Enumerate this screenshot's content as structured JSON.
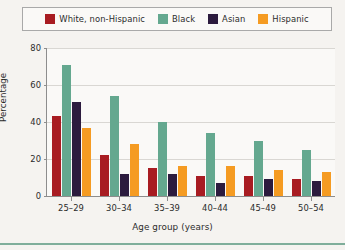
{
  "legend": {
    "entries": [
      {
        "label": "White, non-Hispanic",
        "color": "#a81c22"
      },
      {
        "label": "Black",
        "color": "#64a88f"
      },
      {
        "label": "Asian",
        "color": "#2c1b3e"
      },
      {
        "label": "Hispanic",
        "color": "#f59b22"
      }
    ]
  },
  "axes": {
    "y_title": "Percentage",
    "x_title": "Age group (years)",
    "y_ticks": [
      "0",
      "20",
      "40",
      "60",
      "80"
    ]
  },
  "chart_data": {
    "type": "bar",
    "title": "",
    "subtitle": "",
    "xlabel": "Age group (years)",
    "ylabel": "Percentage",
    "ylim": [
      0,
      80
    ],
    "yticks": [
      0,
      20,
      40,
      60,
      80
    ],
    "grid": true,
    "legend_position": "top",
    "categories": [
      "25–29",
      "30–34",
      "35–39",
      "40–44",
      "45–49",
      "50–54"
    ],
    "series": [
      {
        "name": "White, non-Hispanic",
        "color": "#a81c22",
        "values": [
          43,
          22,
          15,
          11,
          11,
          9
        ]
      },
      {
        "name": "Black",
        "color": "#64a88f",
        "values": [
          71,
          54,
          40,
          34,
          30,
          25
        ]
      },
      {
        "name": "Asian",
        "color": "#2c1b3e",
        "values": [
          51,
          12,
          12,
          7,
          9,
          8
        ]
      },
      {
        "name": "Hispanic",
        "color": "#f59b22",
        "values": [
          37,
          28,
          16,
          16,
          14,
          13
        ]
      }
    ]
  }
}
